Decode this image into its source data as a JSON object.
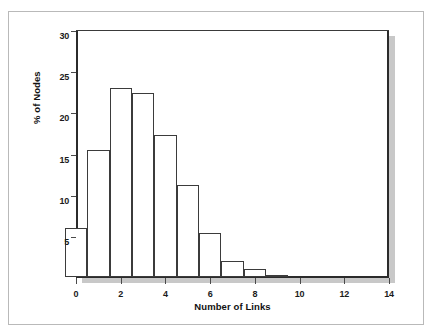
{
  "chart_data": {
    "type": "bar",
    "title": "",
    "xlabel": "Number of Links",
    "ylabel": "% of Nodes",
    "categories": [
      0,
      1,
      2,
      3,
      4,
      5,
      6,
      7,
      8,
      9
    ],
    "values": [
      5.9,
      15.4,
      23.0,
      22.3,
      17.3,
      11.2,
      5.4,
      2.0,
      1.0,
      0.3
    ],
    "xlim": [
      0,
      14
    ],
    "ylim": [
      0,
      30
    ],
    "xticks": [
      "0",
      "2",
      "4",
      "6",
      "8",
      "10",
      "12",
      "14"
    ],
    "xtick_values": [
      0,
      2,
      4,
      6,
      8,
      10,
      12,
      14
    ],
    "yticks": [
      "5",
      "10",
      "15",
      "20",
      "25",
      "30"
    ],
    "ytick_values": [
      5,
      10,
      15,
      20,
      25,
      30
    ],
    "grid": false,
    "legend": false,
    "bar_width": 1,
    "bar_align": "center",
    "colors": {
      "bar_fill": "#ffffff",
      "bar_edge": "#3b3b3b",
      "axis": "#2b2b2b",
      "text": "#111111",
      "shadow": "#9a9a9a",
      "outer_border": "#b9b9b9",
      "background": "#ffffff"
    }
  }
}
